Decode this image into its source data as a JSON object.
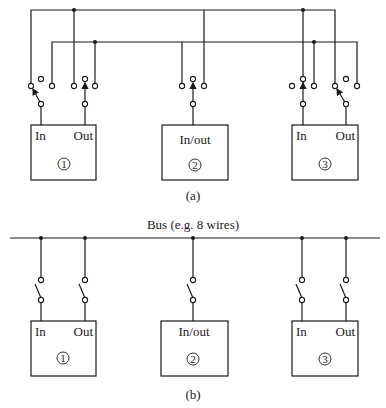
{
  "diagram_a": {
    "caption": "(a)",
    "units": [
      {
        "id": "1",
        "ports": [
          "In",
          "Out"
        ]
      },
      {
        "id": "2",
        "ports": [
          "In/out"
        ]
      },
      {
        "id": "3",
        "ports": [
          "In",
          "Out"
        ]
      }
    ]
  },
  "diagram_b": {
    "caption": "(b)",
    "bus_label": "Bus (e.g. 8 wires)",
    "units": [
      {
        "id": "1",
        "ports": [
          "In",
          "Out"
        ]
      },
      {
        "id": "2",
        "ports": [
          "In/out"
        ]
      },
      {
        "id": "3",
        "ports": [
          "In",
          "Out"
        ]
      }
    ]
  }
}
